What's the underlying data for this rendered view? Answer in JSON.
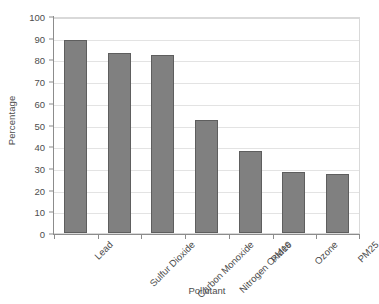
{
  "chart_data": {
    "type": "bar",
    "title": "",
    "xlabel": "Pollutant",
    "ylabel": "Percentage",
    "categories": [
      "Lead",
      "Sulfur Dioxide",
      "Carbon Monoxide",
      "Nitrogen Oxides",
      "PM10",
      "Ozone",
      "PM25"
    ],
    "values": [
      89,
      83,
      82,
      52,
      38,
      28,
      27
    ],
    "ylim": [
      0,
      100
    ],
    "ytick_labels": [
      "100",
      "90",
      "80",
      "70",
      "60",
      "50",
      "40",
      "30",
      "20",
      "10",
      "0"
    ],
    "ytick_values": [
      100,
      90,
      80,
      70,
      60,
      50,
      40,
      30,
      20,
      10,
      0
    ],
    "grid": true,
    "legend": false,
    "bar_color": "#808080",
    "bar_border_color": "#5e5e5e",
    "gridline_color": "#e3e3e3",
    "axis_color": "#8c8c8c",
    "text_color": "#4d4d4d",
    "background_color": "#ffffff"
  }
}
